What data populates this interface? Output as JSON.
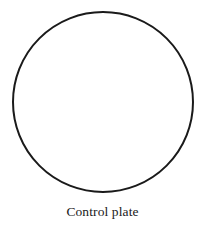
{
  "figure": {
    "caption": "Control plate",
    "background_color": "#ffffff",
    "stroke_color": "#1a1a1a",
    "text_color": "#1a1a1a",
    "shape": {
      "name": "petri-dish-circle",
      "type": "circle",
      "center_x": 103,
      "center_y": 102,
      "radius": 90,
      "stroke_width": 2,
      "fill": "none"
    }
  }
}
